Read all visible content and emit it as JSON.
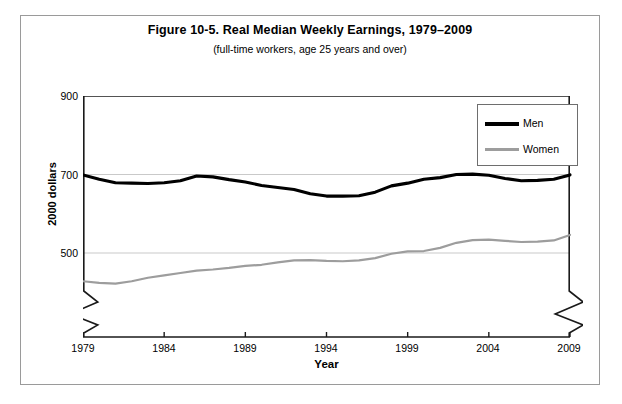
{
  "figure": {
    "title": "Figure 10-5. Real Median Weekly Earnings, 1979–2009",
    "subtitle": "(full-time workers, age 25 years and over)"
  },
  "axes": {
    "y_title": "2000 dollars",
    "x_title": "Year",
    "y_ticks": [
      "900",
      "700",
      "500"
    ],
    "x_ticks": [
      "1979",
      "1984",
      "1989",
      "1994",
      "1999",
      "2004",
      "2009"
    ]
  },
  "legend": {
    "items": [
      {
        "label": "Men",
        "color": "#000000"
      },
      {
        "label": "Women",
        "color": "#9d9d9d"
      }
    ]
  },
  "chart_data": {
    "type": "line",
    "title": "Figure 10-5. Real Median Weekly Earnings, 1979–2009",
    "subtitle": "(full-time workers, age 25 years and over)",
    "xlabel": "Year",
    "ylabel": "2000 dollars",
    "xlim": [
      1979,
      2009
    ],
    "ylim": [
      400,
      900
    ],
    "yticks": [
      500,
      700,
      900
    ],
    "xticks": [
      1979,
      1984,
      1989,
      1994,
      1999,
      2004,
      2009
    ],
    "grid": "horizontal gridlines at 500 and 700",
    "axis_break": "zigzag break on both vertical axes below 400",
    "legend_position": "upper right",
    "x": [
      1979,
      1980,
      1981,
      1982,
      1983,
      1984,
      1985,
      1986,
      1987,
      1988,
      1989,
      1990,
      1991,
      1992,
      1993,
      1994,
      1995,
      1996,
      1997,
      1998,
      1999,
      2000,
      2001,
      2002,
      2003,
      2004,
      2005,
      2006,
      2007,
      2008,
      2009
    ],
    "series": [
      {
        "name": "Men",
        "color": "#000000",
        "values": [
          699,
          688,
          679,
          678,
          677,
          679,
          684,
          696,
          694,
          687,
          681,
          672,
          667,
          662,
          651,
          645,
          645,
          646,
          655,
          671,
          678,
          688,
          692,
          700,
          701,
          698,
          690,
          684,
          685,
          688,
          699
        ]
      },
      {
        "name": "Women",
        "color": "#9d9d9d",
        "values": [
          428,
          424,
          422,
          428,
          437,
          443,
          449,
          455,
          458,
          462,
          467,
          470,
          476,
          481,
          482,
          480,
          479,
          481,
          487,
          498,
          504,
          505,
          513,
          526,
          533,
          534,
          531,
          528,
          529,
          532,
          546
        ]
      }
    ]
  }
}
